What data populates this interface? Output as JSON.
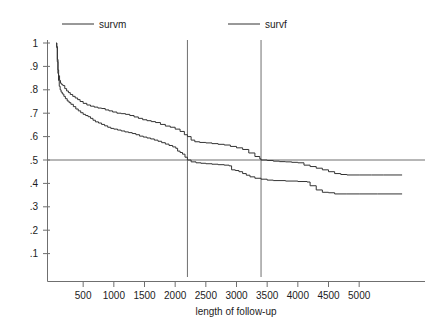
{
  "chart_data": {
    "type": "line",
    "title": "",
    "xlabel": "length of follow-up",
    "ylabel": "",
    "xlim": [
      0,
      5700
    ],
    "ylim": [
      0,
      1.02
    ],
    "grid": false,
    "legend_position": "top",
    "xticks": [
      500,
      1000,
      1500,
      2000,
      2500,
      3000,
      3500,
      4000,
      4500,
      5000
    ],
    "xtick_labels": [
      "500",
      "1000",
      "1500",
      "2000",
      "2500",
      "3000",
      "3500",
      "4000",
      "4500",
      "5000"
    ],
    "yticks": [
      0.1,
      0.2,
      0.3,
      0.4,
      0.5,
      0.6,
      0.7,
      0.8,
      0.9,
      1.0
    ],
    "ytick_labels": [
      ".1",
      ".2",
      ".3",
      ".4",
      ".5",
      ".6",
      ".7",
      ".8",
      ".9",
      "1"
    ],
    "reference_lines": {
      "horizontal": [
        0.5
      ],
      "vertical": [
        2200,
        3400
      ]
    },
    "annotations": [
      "median survival for survf (lower curve) at length of follow-up = 2200",
      "median survival for survm (upper curve) at length of follow-up = 3400"
    ],
    "series": [
      {
        "name": "survm",
        "color": "#333333",
        "points": [
          [
            60,
            1.0
          ],
          [
            70,
            0.985
          ],
          [
            80,
            0.93
          ],
          [
            90,
            0.885
          ],
          [
            100,
            0.86
          ],
          [
            115,
            0.84
          ],
          [
            130,
            0.828
          ],
          [
            150,
            0.822
          ],
          [
            170,
            0.818
          ],
          [
            200,
            0.805
          ],
          [
            230,
            0.795
          ],
          [
            260,
            0.788
          ],
          [
            290,
            0.78
          ],
          [
            330,
            0.772
          ],
          [
            370,
            0.765
          ],
          [
            410,
            0.758
          ],
          [
            450,
            0.75
          ],
          [
            500,
            0.742
          ],
          [
            560,
            0.735
          ],
          [
            620,
            0.73
          ],
          [
            680,
            0.726
          ],
          [
            740,
            0.722
          ],
          [
            800,
            0.72
          ],
          [
            860,
            0.714
          ],
          [
            920,
            0.71
          ],
          [
            980,
            0.705
          ],
          [
            1050,
            0.7
          ],
          [
            1120,
            0.698
          ],
          [
            1190,
            0.695
          ],
          [
            1260,
            0.69
          ],
          [
            1330,
            0.684
          ],
          [
            1400,
            0.678
          ],
          [
            1470,
            0.672
          ],
          [
            1540,
            0.668
          ],
          [
            1610,
            0.664
          ],
          [
            1680,
            0.66
          ],
          [
            1760,
            0.652
          ],
          [
            1840,
            0.645
          ],
          [
            1920,
            0.64
          ],
          [
            2000,
            0.632
          ],
          [
            2080,
            0.622
          ],
          [
            2150,
            0.608
          ],
          [
            2200,
            0.6
          ],
          [
            2260,
            0.585
          ],
          [
            2320,
            0.578
          ],
          [
            2400,
            0.575
          ],
          [
            2500,
            0.573
          ],
          [
            2600,
            0.57
          ],
          [
            2700,
            0.567
          ],
          [
            2800,
            0.564
          ],
          [
            2900,
            0.558
          ],
          [
            3000,
            0.552
          ],
          [
            3100,
            0.545
          ],
          [
            3200,
            0.53
          ],
          [
            3300,
            0.515
          ],
          [
            3380,
            0.505
          ],
          [
            3400,
            0.5
          ],
          [
            3500,
            0.498
          ],
          [
            3600,
            0.495
          ],
          [
            3700,
            0.493
          ],
          [
            3800,
            0.492
          ],
          [
            3900,
            0.49
          ],
          [
            4000,
            0.488
          ],
          [
            4100,
            0.478
          ],
          [
            4200,
            0.472
          ],
          [
            4300,
            0.465
          ],
          [
            4400,
            0.458
          ],
          [
            4500,
            0.45
          ],
          [
            4600,
            0.442
          ],
          [
            4700,
            0.438
          ],
          [
            4800,
            0.436
          ],
          [
            5000,
            0.436
          ],
          [
            5200,
            0.436
          ],
          [
            5400,
            0.436
          ],
          [
            5700,
            0.436
          ]
        ]
      },
      {
        "name": "survf",
        "color": "#333333",
        "points": [
          [
            60,
            1.0
          ],
          [
            68,
            0.98
          ],
          [
            78,
            0.92
          ],
          [
            88,
            0.87
          ],
          [
            98,
            0.84
          ],
          [
            110,
            0.815
          ],
          [
            125,
            0.8
          ],
          [
            140,
            0.79
          ],
          [
            160,
            0.782
          ],
          [
            185,
            0.772
          ],
          [
            210,
            0.762
          ],
          [
            240,
            0.752
          ],
          [
            270,
            0.745
          ],
          [
            300,
            0.738
          ],
          [
            340,
            0.728
          ],
          [
            380,
            0.718
          ],
          [
            420,
            0.71
          ],
          [
            460,
            0.702
          ],
          [
            500,
            0.695
          ],
          [
            540,
            0.69
          ],
          [
            580,
            0.685
          ],
          [
            620,
            0.678
          ],
          [
            660,
            0.67
          ],
          [
            700,
            0.663
          ],
          [
            750,
            0.658
          ],
          [
            800,
            0.652
          ],
          [
            850,
            0.646
          ],
          [
            900,
            0.64
          ],
          [
            950,
            0.635
          ],
          [
            1000,
            0.632
          ],
          [
            1060,
            0.628
          ],
          [
            1120,
            0.624
          ],
          [
            1180,
            0.62
          ],
          [
            1240,
            0.617
          ],
          [
            1300,
            0.613
          ],
          [
            1360,
            0.608
          ],
          [
            1420,
            0.602
          ],
          [
            1480,
            0.598
          ],
          [
            1540,
            0.594
          ],
          [
            1600,
            0.59
          ],
          [
            1660,
            0.585
          ],
          [
            1720,
            0.58
          ],
          [
            1780,
            0.574
          ],
          [
            1840,
            0.568
          ],
          [
            1900,
            0.562
          ],
          [
            1960,
            0.556
          ],
          [
            2010,
            0.55
          ],
          [
            2040,
            0.538
          ],
          [
            2080,
            0.532
          ],
          [
            2120,
            0.525
          ],
          [
            2160,
            0.512
          ],
          [
            2200,
            0.5
          ],
          [
            2260,
            0.492
          ],
          [
            2340,
            0.488
          ],
          [
            2420,
            0.486
          ],
          [
            2500,
            0.484
          ],
          [
            2600,
            0.482
          ],
          [
            2700,
            0.48
          ],
          [
            2800,
            0.478
          ],
          [
            2880,
            0.475
          ],
          [
            2920,
            0.458
          ],
          [
            2980,
            0.455
          ],
          [
            3040,
            0.45
          ],
          [
            3100,
            0.442
          ],
          [
            3160,
            0.435
          ],
          [
            3220,
            0.428
          ],
          [
            3300,
            0.422
          ],
          [
            3400,
            0.418
          ],
          [
            3500,
            0.414
          ],
          [
            3600,
            0.412
          ],
          [
            3800,
            0.41
          ],
          [
            4000,
            0.408
          ],
          [
            4150,
            0.406
          ],
          [
            4200,
            0.39
          ],
          [
            4300,
            0.372
          ],
          [
            4400,
            0.362
          ],
          [
            4500,
            0.36
          ],
          [
            4600,
            0.355
          ],
          [
            4800,
            0.355
          ],
          [
            5000,
            0.355
          ],
          [
            5300,
            0.355
          ],
          [
            5700,
            0.355
          ]
        ]
      }
    ]
  },
  "legend": {
    "entries": [
      {
        "label": "survm"
      },
      {
        "label": "survf"
      }
    ]
  }
}
